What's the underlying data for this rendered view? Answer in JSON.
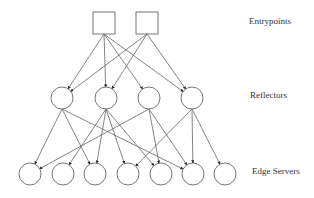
{
  "diagram": {
    "layers": [
      {
        "id": "entrypoints",
        "label": "Entrypoints",
        "shape": "square",
        "nodes": [
          {
            "id": "ep1",
            "x": 104,
            "y": 23
          },
          {
            "id": "ep2",
            "x": 147,
            "y": 23
          }
        ]
      },
      {
        "id": "reflectors",
        "label": "Reflectors",
        "shape": "circle",
        "nodes": [
          {
            "id": "r1",
            "x": 62,
            "y": 98
          },
          {
            "id": "r2",
            "x": 106,
            "y": 98
          },
          {
            "id": "r3",
            "x": 149,
            "y": 98
          },
          {
            "id": "r4",
            "x": 192,
            "y": 98
          }
        ]
      },
      {
        "id": "edge_servers",
        "label": "Edge Servers",
        "shape": "circle",
        "nodes": [
          {
            "id": "e1",
            "x": 30,
            "y": 174
          },
          {
            "id": "e2",
            "x": 63,
            "y": 174
          },
          {
            "id": "e3",
            "x": 95,
            "y": 174
          },
          {
            "id": "e4",
            "x": 128,
            "y": 174
          },
          {
            "id": "e5",
            "x": 161,
            "y": 174
          },
          {
            "id": "e6",
            "x": 193,
            "y": 174
          },
          {
            "id": "e7",
            "x": 225,
            "y": 174
          }
        ]
      }
    ],
    "edges": [
      [
        "ep1",
        "r1"
      ],
      [
        "ep1",
        "r2"
      ],
      [
        "ep1",
        "r3"
      ],
      [
        "ep1",
        "r4"
      ],
      [
        "ep2",
        "r1"
      ],
      [
        "ep2",
        "r2"
      ],
      [
        "ep2",
        "r4"
      ],
      [
        "r1",
        "e1"
      ],
      [
        "r1",
        "e3"
      ],
      [
        "r1",
        "e6"
      ],
      [
        "r2",
        "e2"
      ],
      [
        "r2",
        "e3"
      ],
      [
        "r2",
        "e4"
      ],
      [
        "r2",
        "e5"
      ],
      [
        "r3",
        "e1"
      ],
      [
        "r3",
        "e5"
      ],
      [
        "r3",
        "e6"
      ],
      [
        "r4",
        "e4"
      ],
      [
        "r4",
        "e6"
      ],
      [
        "r4",
        "e7"
      ]
    ],
    "labels": {
      "entrypoints": "Entrypoints",
      "reflectors": "Reflectors",
      "edge_servers": "Edge Servers"
    },
    "colors": {
      "stroke": "#666666",
      "text": "#333333",
      "arrow": "#222222"
    }
  }
}
